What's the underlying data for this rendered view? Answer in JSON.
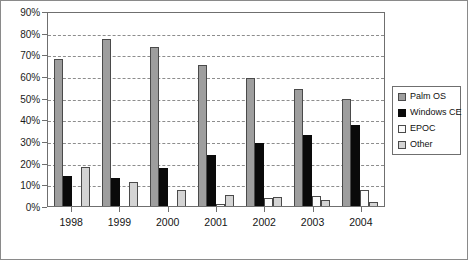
{
  "chart_data": {
    "type": "bar",
    "title": "",
    "subtitle": "",
    "xlabel": "",
    "ylabel": "",
    "categories": [
      "1998",
      "1999",
      "2000",
      "2001",
      "2002",
      "2003",
      "2004"
    ],
    "ylim": [
      0,
      90
    ],
    "ytick_values": [
      0,
      10,
      20,
      30,
      40,
      50,
      60,
      70,
      80,
      90
    ],
    "ytick_labels": [
      "0%",
      "10%",
      "20%",
      "30%",
      "40%",
      "50%",
      "60%",
      "70%",
      "80%",
      "90%"
    ],
    "grid": true,
    "grid_style": "dashed-horizontal",
    "legend_position": "right",
    "series": [
      {
        "name": "Palm OS",
        "color": "#9e9e9e",
        "values": [
          68,
          77,
          73.5,
          65,
          59,
          54,
          49.5
        ]
      },
      {
        "name": "Windows CE",
        "color": "#0a0a0a",
        "values": [
          14,
          13,
          17.5,
          23.5,
          29,
          33,
          37.5
        ]
      },
      {
        "name": "EPOC",
        "color": "#fbfbfb",
        "values": [
          0,
          0,
          0,
          1,
          3.5,
          4.5,
          7.5
        ]
      },
      {
        "name": "Other",
        "color": "#d4d4d4",
        "values": [
          18,
          11,
          7.5,
          5,
          4,
          3,
          2
        ]
      }
    ]
  },
  "legend": {
    "items": [
      {
        "label": "Palm OS",
        "color": "#9e9e9e"
      },
      {
        "label": "Windows CE",
        "color": "#0a0a0a"
      },
      {
        "label": "EPOC",
        "color": "#fbfbfb"
      },
      {
        "label": "Other",
        "color": "#d4d4d4"
      }
    ]
  }
}
